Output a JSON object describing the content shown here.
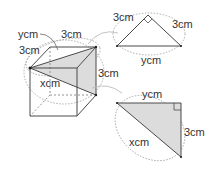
{
  "diagram": {
    "type": "cube-with-cross-section-triangles",
    "colors": {
      "line": "#4a4a4a",
      "dashed": "#888888",
      "shade": "#dcdcdc",
      "background": "#ffffff"
    },
    "cube": {
      "labels": {
        "y_label": "ycm",
        "edge_top": "3cm",
        "edge_left": "3cm",
        "edge_right": "3cm",
        "x_label": "xcm"
      }
    },
    "top_triangle": {
      "left_side": "3cm",
      "right_side": "3cm",
      "base": "ycm",
      "right_angle_at": "apex"
    },
    "bottom_triangle": {
      "top_side": "ycm",
      "right_side": "3cm",
      "hypotenuse": "xcm",
      "right_angle_at": "top-right"
    }
  }
}
